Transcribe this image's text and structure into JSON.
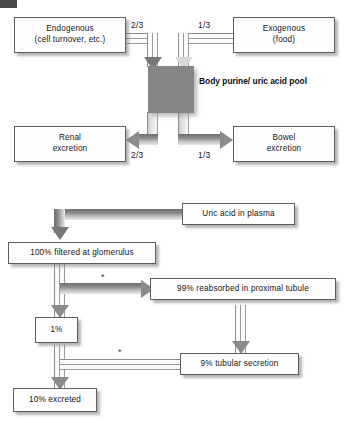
{
  "figure": {
    "scan_mark": "scan-edge-mark"
  },
  "diagram_purine_pool": {
    "name": "body purine / uric acid pool balance",
    "boxes": {
      "endogenous_line1": "Endogenous",
      "endogenous_line2": "(cell turnover, etc.)",
      "exogenous_line1": "Exogenous",
      "exogenous_line2": "(food)",
      "renal_line1": "Renal",
      "renal_line2": "excretion",
      "bowel_line1": "Bowel",
      "bowel_line2": "excretion"
    },
    "pool": {
      "label_line1": "Body purine/",
      "label_line2": "uric acid pool"
    },
    "labels": {
      "endogenous_fraction": "2/3",
      "exogenous_fraction": "1/3",
      "renal_fraction": "2/3",
      "bowel_fraction": "1/3"
    }
  },
  "diagram_renal_handling": {
    "name": "renal handling of uric acid",
    "boxes": {
      "plasma": "Uric acid in plasma",
      "filtered": "100% filtered at glomerulus",
      "reabsorbed": "99% reabsorbed in proximal tubule",
      "one_percent": "1%",
      "secretion": "9% tubular secretion",
      "excreted": "10% excreted"
    },
    "annotations": {
      "asterisk_reabsorption": "*",
      "asterisk_secretion": "*"
    }
  },
  "colors": {
    "box_border": "#5d5d5d",
    "box_fill": "#fefefe",
    "pool_fill": "#858585",
    "arrow_grey": "#8b8b8b",
    "text": "#141414"
  }
}
